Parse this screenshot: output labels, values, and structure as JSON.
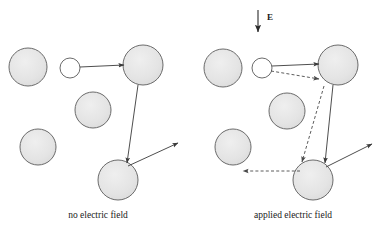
{
  "figure": {
    "title": "",
    "background_color": "#ffffff",
    "width": 379,
    "height": 233,
    "sphere_fill": "#e3e3e3",
    "sphere_stroke": "#6b6b6b",
    "small_sphere_fill": "#ffffff",
    "arrow_color": "#3a3a3a",
    "dashed_arrow_color": "#5a5a5a"
  },
  "field_indicator": {
    "label": "E",
    "direction": "down",
    "x": 258,
    "y_start": 10,
    "y_end": 33,
    "label_x": 267,
    "label_y": 19
  },
  "panels": [
    {
      "id": "no-field",
      "caption": "no electric field",
      "caption_x": 98,
      "caption_y": 217,
      "spheres": [
        {
          "name": "sphere-upper-left",
          "cx": 28,
          "cy": 67,
          "r": 19,
          "kind": "large"
        },
        {
          "name": "sphere-small-white",
          "cx": 70,
          "cy": 68,
          "r": 10,
          "kind": "small"
        },
        {
          "name": "sphere-upper-right",
          "cx": 143,
          "cy": 65,
          "r": 20,
          "kind": "large"
        },
        {
          "name": "sphere-middle",
          "cx": 93,
          "cy": 110,
          "r": 18,
          "kind": "large"
        },
        {
          "name": "sphere-lower-left",
          "cx": 38,
          "cy": 147,
          "r": 18,
          "kind": "large"
        },
        {
          "name": "sphere-bottom",
          "cx": 118,
          "cy": 180,
          "r": 20,
          "kind": "large"
        }
      ],
      "arrows": [
        {
          "name": "arrow-white-to-upper-right",
          "x1": 80,
          "y1": 67,
          "x2": 122,
          "y2": 65,
          "style": "solid"
        },
        {
          "name": "arrow-upper-right-to-bottom",
          "x1": 138,
          "y1": 85,
          "x2": 127,
          "y2": 161,
          "style": "solid"
        },
        {
          "name": "arrow-bottom-outgoing",
          "x1": 129,
          "y1": 166,
          "x2": 178,
          "y2": 143,
          "style": "solid"
        }
      ]
    },
    {
      "id": "applied-field",
      "caption": "applied electric field",
      "caption_x": 293,
      "caption_y": 217,
      "spheres": [
        {
          "name": "sphere-upper-left",
          "cx": 223,
          "cy": 68,
          "r": 19,
          "kind": "large"
        },
        {
          "name": "sphere-small-white",
          "cx": 262,
          "cy": 68,
          "r": 10,
          "kind": "small"
        },
        {
          "name": "sphere-upper-right",
          "cx": 338,
          "cy": 65,
          "r": 20,
          "kind": "large"
        },
        {
          "name": "sphere-middle",
          "cx": 287,
          "cy": 111,
          "r": 18,
          "kind": "large"
        },
        {
          "name": "sphere-lower-left",
          "cx": 233,
          "cy": 147,
          "r": 18,
          "kind": "large"
        },
        {
          "name": "sphere-bottom",
          "cx": 313,
          "cy": 180,
          "r": 20,
          "kind": "large"
        }
      ],
      "arrows": [
        {
          "name": "arrow-white-to-upper-right",
          "x1": 272,
          "y1": 66,
          "x2": 317,
          "y2": 64,
          "style": "solid"
        },
        {
          "name": "arrow-upper-right-to-bottom",
          "x1": 333,
          "y1": 85,
          "x2": 325,
          "y2": 161,
          "style": "solid"
        },
        {
          "name": "arrow-bottom-outgoing",
          "x1": 327,
          "y1": 167,
          "x2": 372,
          "y2": 144,
          "style": "solid"
        },
        {
          "name": "dashed-arrow-white-to-upper-right",
          "x1": 271,
          "y1": 70,
          "x2": 318,
          "y2": 79,
          "style": "dashed"
        },
        {
          "name": "dashed-arrow-upper-right-to-bottom",
          "x1": 323,
          "y1": 86,
          "x2": 302,
          "y2": 160,
          "style": "dashed"
        },
        {
          "name": "dashed-arrow-bottom-to-left",
          "x1": 299,
          "y1": 171,
          "x2": 243,
          "y2": 171,
          "style": "dashed"
        }
      ]
    }
  ]
}
